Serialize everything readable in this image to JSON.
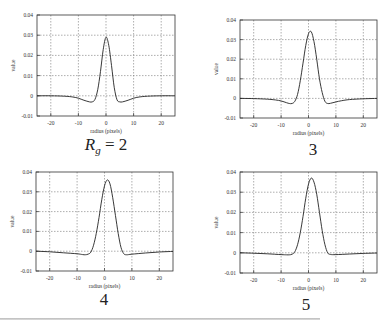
{
  "figure": {
    "captions": [
      "R_g = 2",
      "3",
      "4",
      "5"
    ],
    "caption_main": {
      "symbol": "R",
      "subscript": "g",
      "rest": "= 2"
    }
  },
  "chart_data": [
    {
      "type": "line",
      "title": "",
      "caption": "R_g = 2",
      "xlabel": "radius (pixels)",
      "ylabel": "value",
      "xlim": [
        -25,
        25
      ],
      "ylim": [
        -0.01,
        0.04
      ],
      "xticks": [
        -20,
        -10,
        0,
        10,
        20
      ],
      "yticks": [
        -0.01,
        0,
        0.01,
        0.02,
        0.03,
        0.04
      ],
      "ytick_labels": [
        "-0.01",
        "0",
        "0.01",
        "0.02",
        "0.03",
        "0.04"
      ],
      "grid": true,
      "x": [
        -25,
        -20,
        -15,
        -12,
        -10,
        -8,
        -6,
        -5,
        -4,
        -3,
        -2,
        -1,
        0,
        1,
        2,
        3,
        4,
        5,
        6,
        8,
        10,
        12,
        15,
        20,
        25
      ],
      "values": [
        0,
        0,
        -0.0002,
        -0.0006,
        -0.0012,
        -0.0022,
        -0.003,
        -0.003,
        -0.0018,
        0.003,
        0.012,
        0.023,
        0.029,
        0.025,
        0.015,
        0.004,
        -0.002,
        -0.003,
        -0.003,
        -0.0022,
        -0.0012,
        -0.0006,
        -0.0002,
        0,
        0
      ]
    },
    {
      "type": "line",
      "title": "",
      "caption": "3",
      "xlabel": "radius (pixels)",
      "ylabel": "value",
      "xlim": [
        -25,
        25
      ],
      "ylim": [
        -0.01,
        0.04
      ],
      "xticks": [
        -20,
        -10,
        0,
        10,
        20
      ],
      "yticks": [
        -0.01,
        0,
        0.01,
        0.02,
        0.03,
        0.04
      ],
      "ytick_labels": [
        "-0.01",
        "0",
        "0.01",
        "0.02",
        "0.03",
        "0.04"
      ],
      "grid": true,
      "x": [
        -25,
        -20,
        -15,
        -12,
        -10,
        -8,
        -7,
        -6,
        -5,
        -4,
        -3,
        -2,
        -1,
        0,
        1,
        2,
        3,
        4,
        5,
        6,
        7,
        8,
        10,
        12,
        15,
        20,
        25
      ],
      "values": [
        0,
        -0.0001,
        -0.0004,
        -0.0008,
        -0.0013,
        -0.0022,
        -0.0026,
        -0.0026,
        -0.0015,
        0.002,
        0.009,
        0.018,
        0.027,
        0.033,
        0.034,
        0.029,
        0.02,
        0.01,
        0.003,
        -0.0015,
        -0.0026,
        -0.0025,
        -0.0018,
        -0.0012,
        -0.0006,
        -0.0002,
        0
      ]
    },
    {
      "type": "line",
      "title": "",
      "caption": "4",
      "xlabel": "radius (pixels)",
      "ylabel": "value",
      "xlim": [
        -25,
        25
      ],
      "ylim": [
        -0.01,
        0.04
      ],
      "xticks": [
        -20,
        -10,
        0,
        10,
        20
      ],
      "yticks": [
        -0.01,
        0,
        0.01,
        0.02,
        0.03,
        0.04
      ],
      "ytick_labels": [
        "-0.01",
        "0",
        "0.01",
        "0.02",
        "0.03",
        "0.04"
      ],
      "grid": true,
      "x": [
        -25,
        -20,
        -15,
        -10,
        -8,
        -7,
        -6,
        -5,
        -4,
        -3,
        -2,
        -1,
        0,
        1,
        2,
        3,
        4,
        5,
        6,
        7,
        8,
        10,
        15,
        20,
        25
      ],
      "values": [
        0,
        -0.0003,
        -0.0008,
        -0.0013,
        -0.0017,
        -0.0018,
        -0.0015,
        -0.0005,
        0.003,
        0.009,
        0.017,
        0.026,
        0.033,
        0.036,
        0.034,
        0.027,
        0.018,
        0.009,
        0.002,
        -0.0012,
        -0.0018,
        -0.0015,
        -0.0009,
        -0.0004,
        -0.0001
      ]
    },
    {
      "type": "line",
      "title": "",
      "caption": "5",
      "xlabel": "radius (pixels)",
      "ylabel": "value",
      "xlim": [
        -25,
        25
      ],
      "ylim": [
        -0.01,
        0.04
      ],
      "xticks": [
        -20,
        -10,
        0,
        10,
        20
      ],
      "yticks": [
        -0.01,
        0,
        0.01,
        0.02,
        0.03,
        0.04
      ],
      "ytick_labels": [
        "-0.01",
        "0",
        "0.01",
        "0.02",
        "0.03",
        "0.04"
      ],
      "grid": true,
      "x": [
        -25,
        -20,
        -15,
        -10,
        -8,
        -7,
        -6,
        -5,
        -4,
        -3,
        -2,
        -1,
        0,
        1,
        2,
        3,
        4,
        5,
        6,
        7,
        8,
        10,
        15,
        20,
        25
      ],
      "values": [
        0,
        -0.0002,
        -0.0005,
        -0.0009,
        -0.001,
        -0.001,
        -0.0007,
        0.0005,
        0.004,
        0.01,
        0.018,
        0.027,
        0.034,
        0.037,
        0.035,
        0.029,
        0.02,
        0.011,
        0.004,
        0.0,
        -0.0008,
        -0.0009,
        -0.0006,
        -0.0003,
        -0.0001
      ]
    }
  ]
}
